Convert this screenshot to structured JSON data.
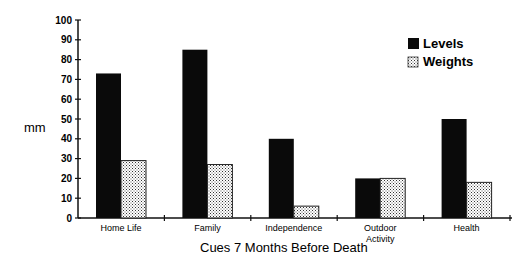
{
  "chart_data": {
    "type": "bar",
    "title": "",
    "xlabel": "Cues 7 Months Before Death",
    "ylabel": "mm",
    "ylim": [
      0,
      100
    ],
    "yticks": [
      0,
      10,
      20,
      30,
      40,
      50,
      60,
      70,
      80,
      90,
      100
    ],
    "grid": false,
    "legend_position": "top-right",
    "categories": [
      "Home Life",
      "Family",
      "Independence",
      "Outdoor Activity",
      "Health"
    ],
    "category_lines": [
      [
        "Home Life"
      ],
      [
        "Family"
      ],
      [
        "Independence"
      ],
      [
        "Outdoor",
        "Activity"
      ],
      [
        "Health"
      ]
    ],
    "series": [
      {
        "name": "Levels",
        "fill": "solid-black",
        "values": [
          73,
          85,
          40,
          20,
          50
        ]
      },
      {
        "name": "Weights",
        "fill": "dotted-pattern",
        "values": [
          29,
          27,
          6,
          20,
          18
        ]
      }
    ]
  },
  "colors": {
    "levels": "#0a0a0a",
    "weights_bg": "#ffffff",
    "weights_dots": "#333333",
    "axis": "#111111"
  }
}
